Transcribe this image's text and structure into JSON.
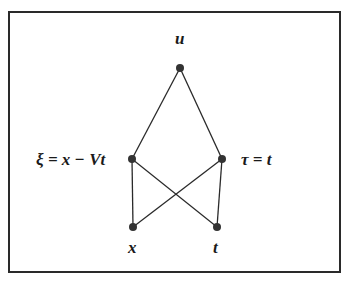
{
  "diagram": {
    "nodes": [
      {
        "id": "u",
        "label": "u",
        "x": 180,
        "y": 68
      },
      {
        "id": "xi",
        "label": "ξ = x − Vt",
        "x": 132,
        "y": 159
      },
      {
        "id": "tau",
        "label": "τ = t",
        "x": 222,
        "y": 159
      },
      {
        "id": "x",
        "label": "x",
        "x": 133,
        "y": 227
      },
      {
        "id": "t",
        "label": "t",
        "x": 217,
        "y": 227
      }
    ],
    "edges": [
      [
        "u",
        "xi"
      ],
      [
        "u",
        "tau"
      ],
      [
        "xi",
        "x"
      ],
      [
        "xi",
        "t"
      ],
      [
        "tau",
        "x"
      ],
      [
        "tau",
        "t"
      ]
    ],
    "colors": {
      "line": "#2a2a2a",
      "node": "#333333"
    }
  }
}
